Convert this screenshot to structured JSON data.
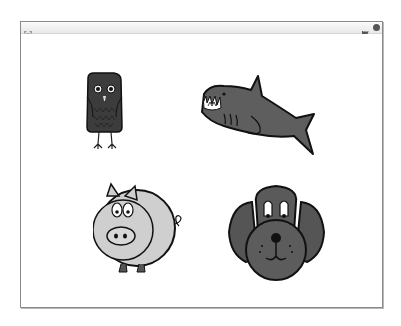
{
  "player": {
    "titlebar": {
      "fullscreen_icon": "fullscreen-arrows-icon",
      "green_flag_icon": "green-flag-icon",
      "stop_icon": "stop-sign-icon"
    },
    "stage": {
      "background": "#ffffff",
      "sprites": [
        {
          "name": "Owl",
          "icon": "owl-sprite",
          "color": "#3a3a3a"
        },
        {
          "name": "Shark",
          "icon": "shark-sprite",
          "color": "#5e5e5e"
        },
        {
          "name": "Pig",
          "icon": "pig-sprite",
          "color": "#c8c8c8"
        },
        {
          "name": "Dog",
          "icon": "dog-sprite",
          "color": "#5a5a5a"
        }
      ]
    }
  }
}
